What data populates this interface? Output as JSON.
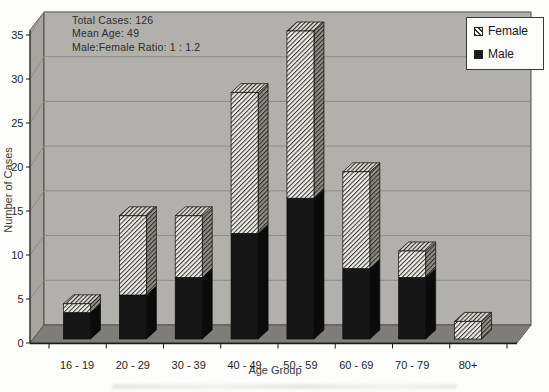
{
  "chart_data": {
    "type": "bar",
    "subtype": "3d-stacked-column",
    "title": "",
    "categories": [
      "16 - 19",
      "20 - 29",
      "30 - 39",
      "40 - 49",
      "50 - 59",
      "60 - 69",
      "70 - 79",
      "80+"
    ],
    "series": [
      {
        "name": "Male",
        "values": [
          3,
          5,
          7,
          12,
          16,
          8,
          7,
          0
        ],
        "color": "#161616",
        "style": "solid-dark"
      },
      {
        "name": "Female",
        "values": [
          1,
          9,
          7,
          16,
          19,
          11,
          3,
          2
        ],
        "color": "#efeeea",
        "style": "diagonal-hatch"
      }
    ],
    "totals": [
      4,
      14,
      14,
      28,
      35,
      19,
      10,
      2
    ],
    "xlabel": "Age Group",
    "ylabel": "Number of Cases",
    "ylim": [
      0,
      35
    ],
    "yticks": [
      0,
      5,
      10,
      15,
      20,
      25,
      30,
      35
    ],
    "grid": true,
    "legend_position": "top-right",
    "legend": {
      "items": [
        {
          "label": "Female",
          "swatch": "diagonal-hatch"
        },
        {
          "label": "Male",
          "swatch": "solid-dark"
        }
      ]
    },
    "annotation": {
      "lines": [
        "Total Cases: 126",
        "Mean Age: 49",
        "Male:Female Ratio: 1 : 1.2"
      ]
    }
  },
  "colors": {
    "background": "#fcfcfa",
    "wall": "#b1b0ac",
    "left_wall": "#a6a5a0",
    "floor": "#7e7d79",
    "gridline": "#8d8c88",
    "frame": "#4a4a46",
    "axis_line": "#1a1a1a",
    "male_front": "#161616",
    "male_side": "#0b0b0b",
    "bar_outline": "#0a0a0a"
  }
}
